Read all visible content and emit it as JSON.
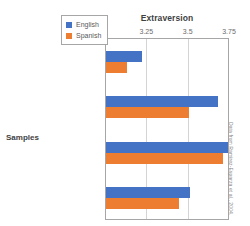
{
  "chart_data": {
    "type": "bar",
    "orientation": "horizontal",
    "title": "Extraversion",
    "xlabel": "Extraversion",
    "ylabel": "Samples",
    "xlim": [
      3,
      3.75
    ],
    "xticks": [
      "3",
      "3.25",
      "3.5",
      "3.75"
    ],
    "xtick_values": [
      3,
      3.25,
      3.5,
      3.75
    ],
    "grid": "vertical",
    "legend_position": "top-right-inside",
    "categories": [
      "Monolinguals\nfrom US and\nMexico",
      "Bilinguals\nfrom\nAustin, Texas",
      "Bilinguals\nfrom\nMexico/US",
      "Bilinguals from\nSan Francisco Bay\nArea, California"
    ],
    "series": [
      {
        "name": "English",
        "color": "#4472c4",
        "values": [
          3.22,
          3.68,
          3.74,
          3.51
        ]
      },
      {
        "name": "Spanish",
        "color": "#ed7d31",
        "values": [
          3.13,
          3.5,
          3.71,
          3.44
        ]
      }
    ],
    "source_credit": "Data from Ramirez-Esparza et al., 2004."
  },
  "legend": {
    "items": [
      {
        "label": "English",
        "color": "#4472c4"
      },
      {
        "label": "Spanish",
        "color": "#ed7d31"
      }
    ]
  },
  "colors": {
    "english": "#4472c4",
    "spanish": "#ed7d31",
    "axis": "#a6a6a6",
    "grid": "#d4d4d4",
    "text": "#6b6b6b",
    "title": "#3f3f3f"
  }
}
